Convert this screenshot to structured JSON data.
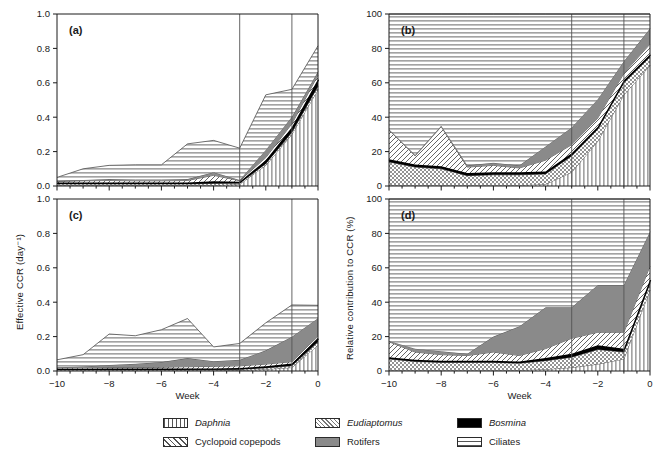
{
  "figure": {
    "panels": [
      {
        "tag": "(a)",
        "id": "panel-a",
        "yaxis": "effective",
        "row": 0,
        "col": 0
      },
      {
        "tag": "(b)",
        "id": "panel-b",
        "yaxis": "relative",
        "row": 0,
        "col": 1
      },
      {
        "tag": "(c)",
        "id": "panel-c",
        "yaxis": "effective",
        "row": 1,
        "col": 0
      },
      {
        "tag": "(d)",
        "id": "panel-d",
        "yaxis": "relative",
        "row": 1,
        "col": 1
      }
    ],
    "axes": {
      "x_label": "Week",
      "y_label_left": "Effective CCR (day⁻¹)",
      "y_label_right": "Relative contribution to CCR (%)",
      "x_ticks": [
        "-10",
        "-8",
        "-6",
        "-4",
        "-2",
        "0"
      ],
      "y_ticks_left": [
        "0.0",
        "0.2",
        "0.4",
        "0.6",
        "0.8",
        "1.0"
      ],
      "y_ticks_right": [
        "0",
        "20",
        "40",
        "60",
        "80",
        "100"
      ],
      "xlim": [
        -10,
        0
      ],
      "ylim_left": [
        0,
        1.0
      ],
      "ylim_right": [
        0,
        100
      ],
      "reference_lines": [
        -3,
        -1
      ]
    },
    "legend": {
      "entries": [
        {
          "label": "Daphnia",
          "pattern": "vertical-lines",
          "italic": true
        },
        {
          "label": "Eudiaptomus",
          "pattern": "cross-stipple",
          "italic": true
        },
        {
          "label": "Bosmina",
          "pattern": "solid-black",
          "italic": true
        },
        {
          "label": "Cyclopoid copepods",
          "pattern": "diagonal-hatch",
          "italic": false
        },
        {
          "label": "Rotifers",
          "pattern": "solid-gray",
          "italic": false
        },
        {
          "label": "Ciliates",
          "pattern": "horizontal-lines",
          "italic": false
        }
      ]
    },
    "colors": {
      "axis": "#1a1a1a",
      "reference_line": "#555555",
      "bosmina": "#000000",
      "rotifers": "#8a8a8a",
      "ciliates_line": "#4d4d4d",
      "hatch": "#555555",
      "background": "#ffffff"
    }
  },
  "chart_data": [
    {
      "type": "area",
      "id": "panel-a",
      "title": "(a)",
      "stacked": true,
      "xlabel": "Week",
      "ylabel": "Effective CCR (day⁻¹)",
      "xlim": [
        -10,
        0
      ],
      "ylim": [
        0,
        1.0
      ],
      "grid": false,
      "legend_position": "figure-bottom",
      "x": [
        -10,
        -9,
        -8,
        -7,
        -6,
        -5,
        -4,
        -3,
        -2,
        -1,
        0
      ],
      "series": [
        {
          "name": "Daphnia",
          "values": [
            0.004,
            0.004,
            0.004,
            0.004,
            0.004,
            0.004,
            0.005,
            0.01,
            0.12,
            0.3,
            0.56
          ]
        },
        {
          "name": "Eudiaptomus",
          "values": [
            0.008,
            0.008,
            0.008,
            0.008,
            0.008,
            0.008,
            0.01,
            0.006,
            0.01,
            0.012,
            0.02
          ]
        },
        {
          "name": "Bosmina",
          "values": [
            0.008,
            0.008,
            0.008,
            0.008,
            0.008,
            0.008,
            0.012,
            0.009,
            0.02,
            0.03,
            0.04
          ]
        },
        {
          "name": "Cyclopoid copepods",
          "values": [
            0.006,
            0.01,
            0.012,
            0.01,
            0.01,
            0.012,
            0.035,
            0.006,
            0.015,
            0.02,
            0.025
          ]
        },
        {
          "name": "Rotifers",
          "values": [
            0.004,
            0.005,
            0.008,
            0.008,
            0.008,
            0.008,
            0.018,
            0.004,
            0.045,
            0.04,
            0.02
          ]
        },
        {
          "name": "Ciliates",
          "values": [
            0.02,
            0.065,
            0.08,
            0.085,
            0.085,
            0.205,
            0.185,
            0.185,
            0.32,
            0.16,
            0.15
          ]
        }
      ],
      "stack_top": [
        0.05,
        0.1,
        0.12,
        0.123,
        0.123,
        0.245,
        0.265,
        0.22,
        0.53,
        0.562,
        0.815
      ]
    },
    {
      "type": "area",
      "id": "panel-b",
      "title": "(b)",
      "stacked": true,
      "xlabel": "Week",
      "ylabel": "Relative contribution to CCR (%)",
      "xlim": [
        -10,
        0
      ],
      "ylim": [
        0,
        100
      ],
      "grid": false,
      "legend_position": "figure-bottom",
      "x": [
        -10,
        -9,
        -8,
        -7,
        -6,
        -5,
        -4,
        -3,
        -2,
        -1,
        0
      ],
      "series": [
        {
          "name": "Daphnia",
          "values": [
            0.5,
            0.5,
            0.5,
            0.5,
            0.5,
            0.5,
            1.0,
            8.0,
            26.0,
            53.0,
            70.0
          ]
        },
        {
          "name": "Eudiaptomus",
          "values": [
            13.5,
            10.5,
            9.5,
            5.5,
            6.0,
            6.0,
            6.0,
            9.5,
            7.0,
            7.0,
            5.0
          ]
        },
        {
          "name": "Bosmina",
          "values": [
            1.5,
            1.5,
            1.5,
            1.5,
            1.5,
            1.5,
            1.5,
            1.5,
            1.5,
            1.5,
            1.5
          ]
        },
        {
          "name": "Cyclopoid copepods",
          "values": [
            17.0,
            5.0,
            23.0,
            3.5,
            4.0,
            2.5,
            6.5,
            5.0,
            5.0,
            4.0,
            6.0
          ]
        },
        {
          "name": "Rotifers",
          "values": [
            0.5,
            0.5,
            0.5,
            1.0,
            1.5,
            1.5,
            8.0,
            10.0,
            11.0,
            7.0,
            9.0
          ]
        },
        {
          "name": "Ciliates",
          "values": [
            67.0,
            82.0,
            65.0,
            88.0,
            86.5,
            88.0,
            77.0,
            66.0,
            49.5,
            27.5,
            8.5
          ]
        }
      ],
      "stack_top": [
        100,
        100,
        100,
        100,
        100,
        100,
        100,
        100,
        100,
        100,
        100
      ]
    },
    {
      "type": "area",
      "id": "panel-c",
      "title": "(c)",
      "stacked": true,
      "xlabel": "Week",
      "ylabel": "Effective CCR (day⁻¹)",
      "xlim": [
        -10,
        0
      ],
      "ylim": [
        0,
        1.0
      ],
      "grid": false,
      "legend_position": "figure-bottom",
      "x": [
        -10,
        -9,
        -8,
        -7,
        -6,
        -5,
        -4,
        -3,
        -2,
        -1,
        0
      ],
      "series": [
        {
          "name": "Daphnia",
          "values": [
            0.003,
            0.003,
            0.003,
            0.003,
            0.003,
            0.003,
            0.003,
            0.004,
            0.01,
            0.02,
            0.15
          ]
        },
        {
          "name": "Eudiaptomus",
          "values": [
            0.006,
            0.006,
            0.006,
            0.006,
            0.006,
            0.006,
            0.006,
            0.006,
            0.008,
            0.01,
            0.02
          ]
        },
        {
          "name": "Bosmina",
          "values": [
            0.004,
            0.004,
            0.005,
            0.005,
            0.005,
            0.006,
            0.006,
            0.007,
            0.01,
            0.014,
            0.02
          ]
        },
        {
          "name": "Cyclopoid copepods",
          "values": [
            0.004,
            0.005,
            0.006,
            0.006,
            0.008,
            0.01,
            0.012,
            0.013,
            0.012,
            0.01,
            0.012
          ]
        },
        {
          "name": "Rotifers",
          "values": [
            0.005,
            0.008,
            0.015,
            0.022,
            0.03,
            0.05,
            0.03,
            0.035,
            0.08,
            0.145,
            0.105
          ]
        },
        {
          "name": "Ciliates",
          "values": [
            0.043,
            0.069,
            0.18,
            0.163,
            0.188,
            0.23,
            0.083,
            0.095,
            0.16,
            0.185,
            0.075
          ]
        }
      ],
      "stack_top": [
        0.065,
        0.095,
        0.215,
        0.205,
        0.24,
        0.305,
        0.14,
        0.16,
        0.28,
        0.384,
        0.382
      ]
    },
    {
      "type": "area",
      "id": "panel-d",
      "title": "(d)",
      "stacked": true,
      "xlabel": "Week",
      "ylabel": "Relative contribution to CCR (%)",
      "xlim": [
        -10,
        0
      ],
      "ylim": [
        0,
        100
      ],
      "grid": false,
      "legend_position": "figure-bottom",
      "x": [
        -10,
        -9,
        -8,
        -7,
        -6,
        -5,
        -4,
        -3,
        -2,
        -1,
        0
      ],
      "series": [
        {
          "name": "Daphnia",
          "values": [
            0.5,
            0.5,
            0.5,
            0.5,
            0.5,
            0.5,
            1.0,
            2.0,
            4.0,
            7.0,
            47.0
          ]
        },
        {
          "name": "Eudiaptomus",
          "values": [
            6.5,
            5.0,
            4.5,
            4.5,
            4.5,
            4.0,
            5.0,
            6.0,
            8.5,
            4.0,
            4.0
          ]
        },
        {
          "name": "Bosmina",
          "values": [
            1.0,
            1.0,
            1.0,
            1.0,
            1.0,
            1.0,
            1.5,
            2.0,
            2.5,
            2.0,
            2.0
          ]
        },
        {
          "name": "Cyclopoid copepods",
          "values": [
            9.0,
            4.5,
            3.5,
            3.0,
            5.0,
            3.5,
            5.5,
            9.0,
            7.5,
            9.5,
            8.0
          ]
        },
        {
          "name": "Rotifers",
          "values": [
            0.5,
            2.0,
            2.0,
            1.0,
            9.0,
            17.0,
            24.0,
            18.0,
            27.5,
            27.5,
            20.0
          ]
        },
        {
          "name": "Ciliates",
          "values": [
            82.5,
            87.0,
            88.5,
            90.0,
            80.0,
            74.0,
            63.0,
            63.0,
            50.0,
            50.0,
            19.0
          ]
        }
      ],
      "stack_top": [
        100,
        100,
        100,
        100,
        100,
        100,
        100,
        100,
        100,
        100,
        100
      ]
    }
  ]
}
